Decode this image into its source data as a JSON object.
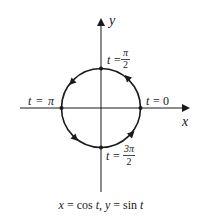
{
  "diagram": {
    "type": "parametric-unit-circle",
    "axes": {
      "x_label": "x",
      "y_label": "y"
    },
    "points": [
      {
        "id": "t0",
        "t_var": "t",
        "eq": "=",
        "value": "0"
      },
      {
        "id": "tpi2",
        "t_var": "t",
        "eq": "=",
        "num": "π",
        "den": "2"
      },
      {
        "id": "tpi",
        "t_var": "t",
        "eq": "=",
        "value": "π"
      },
      {
        "id": "t3pi2",
        "t_var": "t",
        "eq": "=",
        "num": "3π",
        "den": "2"
      }
    ],
    "direction": "counterclockwise",
    "caption": {
      "x_part": "x",
      "eq1": " = cos ",
      "t1": "t",
      "sep": ", ",
      "y_part": "y",
      "eq2": " = sin ",
      "t2": "t"
    },
    "colors": {
      "stroke": "#1a1a1a",
      "background": "#ffffff"
    }
  }
}
